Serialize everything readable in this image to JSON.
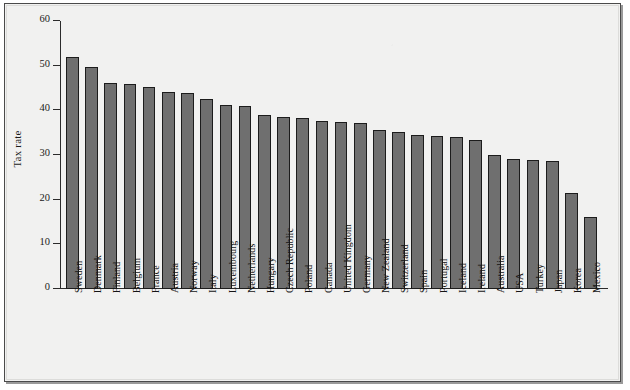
{
  "figure": {
    "background_color": "#f1f1f0",
    "bar_fill_color": "#6f6f6f",
    "bar_edge_color": "#1c1c1c",
    "axis_color": "#2b2b2b"
  },
  "axis": {
    "ylabel": "Tax rate",
    "y_ticks": [
      "0",
      "10",
      "20",
      "30",
      "40",
      "50",
      "60"
    ]
  },
  "chart_data": {
    "type": "bar",
    "title": "",
    "xlabel": "",
    "ylabel": "Tax rate",
    "ylim": [
      0,
      60
    ],
    "ytick_values": [
      0,
      10,
      20,
      30,
      40,
      50,
      60
    ],
    "grid": false,
    "legend": false,
    "orientation": "vertical",
    "categories": [
      "Sweden",
      "Denmark",
      "Finland",
      "Belgium",
      "France",
      "Austria",
      "Norway",
      "Italy",
      "Luxembourg",
      "Netherlands",
      "Hungary",
      "Czech Republic",
      "Poland",
      "Canada",
      "United Kingdom",
      "Germany",
      "New Zealand",
      "Switzerland",
      "Spain",
      "Portugal",
      "Iceland",
      "Ireland",
      "Australia",
      "USA",
      "Turkey",
      "Japan",
      "Korea",
      "Mexico"
    ],
    "values": [
      52.0,
      49.8,
      46.2,
      46.0,
      45.3,
      44.2,
      43.8,
      42.5,
      41.3,
      41.0,
      38.9,
      38.4,
      38.2,
      37.6,
      37.3,
      37.2,
      35.5,
      35.2,
      34.5,
      34.2,
      34.0,
      33.3,
      30.0,
      29.2,
      28.9,
      28.6,
      21.4,
      16.2
    ]
  }
}
